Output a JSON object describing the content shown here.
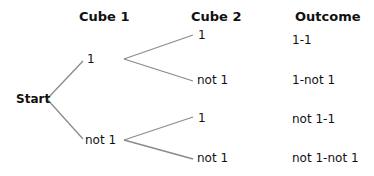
{
  "headers": {
    "cube1": "Cube 1",
    "cube2": "Cube 2",
    "outcome": "Outcome"
  },
  "root": {
    "label": "Start"
  },
  "cube1_nodes": [
    {
      "label": "1"
    },
    {
      "label": "not 1"
    }
  ],
  "cube2_nodes": [
    {
      "label": "1"
    },
    {
      "label": "not 1"
    },
    {
      "label": "1"
    },
    {
      "label": "not 1"
    }
  ],
  "outcomes": [
    {
      "label": "1-1"
    },
    {
      "label": "1-not 1"
    },
    {
      "label": "not 1-1"
    },
    {
      "label": "not 1-not 1"
    }
  ],
  "colors": {
    "line": "#8a8a8a",
    "text": "#111111"
  }
}
